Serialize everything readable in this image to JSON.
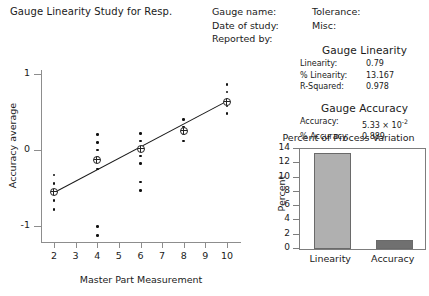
{
  "report": {
    "title": "Gauge Linearity Study for Resp.",
    "fields_left": [
      "Gauge name:",
      "Date of study:",
      "Reported by:"
    ],
    "fields_right": [
      "Tolerance:",
      "Misc:"
    ]
  },
  "gauge_linearity": {
    "heading": "Gauge Linearity",
    "rows": [
      {
        "label": "Linearity:",
        "value": "0.79"
      },
      {
        "label": "% Linearity:",
        "value": "13.167"
      },
      {
        "label": "R-Squared:",
        "value": "0.978"
      }
    ]
  },
  "gauge_accuracy": {
    "heading": "Gauge Accuracy",
    "rows": [
      {
        "label": "Accuracy:",
        "value_mantissa": "5.33 × 10",
        "value_exp": "-2"
      },
      {
        "label": "% Accuracy:",
        "value": "0.889"
      }
    ]
  },
  "chart_data": [
    {
      "type": "scatter",
      "title": "",
      "xlabel": "Master Part Measurement",
      "ylabel": "Accuracy average",
      "xlim": [
        1.4,
        10.6
      ],
      "ylim": [
        -1.18,
        1.05
      ],
      "xticks": [
        2,
        3,
        4,
        5,
        6,
        7,
        8,
        9,
        10
      ],
      "yticks": [
        -1,
        0,
        1
      ],
      "grid": false,
      "legend": "none",
      "series": [
        {
          "name": "Individual accuracy values",
          "points": [
            {
              "x": 2,
              "y": -0.33
            },
            {
              "x": 2,
              "y": -0.44
            },
            {
              "x": 2,
              "y": -0.55
            },
            {
              "x": 2,
              "y": -0.66
            },
            {
              "x": 2,
              "y": -0.78
            },
            {
              "x": 4,
              "y": 0.2
            },
            {
              "x": 4,
              "y": 0.1
            },
            {
              "x": 4,
              "y": 0.0
            },
            {
              "x": 4,
              "y": -0.1
            },
            {
              "x": 4,
              "y": -0.25
            },
            {
              "x": 4,
              "y": -1.0
            },
            {
              "x": 4,
              "y": -1.12
            },
            {
              "x": 6,
              "y": 0.22
            },
            {
              "x": 6,
              "y": 0.12
            },
            {
              "x": 6,
              "y": 0.02
            },
            {
              "x": 6,
              "y": -0.08
            },
            {
              "x": 6,
              "y": -0.18
            },
            {
              "x": 6,
              "y": -0.42
            },
            {
              "x": 6,
              "y": -0.53
            },
            {
              "x": 8,
              "y": 0.4
            },
            {
              "x": 8,
              "y": 0.3
            },
            {
              "x": 8,
              "y": 0.22
            },
            {
              "x": 8,
              "y": 0.12
            },
            {
              "x": 10,
              "y": 0.86
            },
            {
              "x": 10,
              "y": 0.76
            },
            {
              "x": 10,
              "y": 0.66
            },
            {
              "x": 10,
              "y": 0.58
            },
            {
              "x": 10,
              "y": 0.48
            }
          ]
        },
        {
          "name": "Mean accuracy per part",
          "points": [
            {
              "x": 2,
              "y": -0.55
            },
            {
              "x": 4,
              "y": -0.13
            },
            {
              "x": 6,
              "y": 0.02
            },
            {
              "x": 8,
              "y": 0.25
            },
            {
              "x": 10,
              "y": 0.63
            }
          ]
        }
      ],
      "fit_line": {
        "name": "Regression line",
        "x0": 2,
        "y0": -0.55,
        "x1": 10,
        "y1": 0.65
      }
    },
    {
      "type": "bar",
      "title": "Percent of Process Variation",
      "xlabel": "",
      "ylabel": "Percent",
      "categories": [
        "Linearity",
        "Accuracy"
      ],
      "values": [
        13.2,
        1.0
      ],
      "ylim": [
        0,
        14
      ],
      "yticks": [
        0,
        2,
        4,
        6,
        8,
        10,
        12,
        14
      ],
      "grid": false,
      "legend": "none",
      "colors": [
        "#b0b0b0",
        "#707070"
      ]
    }
  ]
}
